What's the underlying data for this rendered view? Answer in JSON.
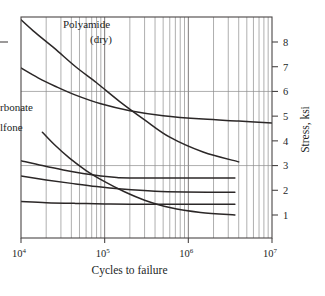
{
  "figure": {
    "background": "#ffffff",
    "frame_color": "#4a4646",
    "curve_color": "#2b2727",
    "grid_color": "#8d8d8d"
  },
  "axes": {
    "x_label": "Cycles to failure",
    "y_label": "Stress, ksi",
    "x_tick_labels": [
      "10",
      "10",
      "10",
      "10"
    ],
    "x_tick_exponents": [
      "4",
      "5",
      "6",
      "7"
    ],
    "y_tick_labels": [
      "8",
      "7",
      "6",
      "5",
      "4",
      "3",
      "2",
      "1"
    ]
  },
  "annotations": {
    "polyamide_line1": "Polyamide",
    "polyamide_line2": "(dry)",
    "carbonate": "rbonate",
    "sulfone": "lfone"
  },
  "chart_data": {
    "type": "line",
    "title": "",
    "xlabel": "Cycles to failure",
    "ylabel": "Stress, ksi",
    "xscale": "log",
    "yscale": "linear",
    "xlim": [
      10000,
      10000000
    ],
    "ylim": [
      0,
      9
    ],
    "xticks": [
      10000,
      100000,
      1000000,
      10000000
    ],
    "xticklabels": [
      "10^4",
      "10^5",
      "10^6",
      "10^7"
    ],
    "yticks": [
      1,
      2,
      3,
      4,
      5,
      6,
      7,
      8
    ],
    "grid": "log-minor vertical gridlines each decade (2-9); horizontal gridlines at stress 6 and 3",
    "legend": "inline curve labels",
    "annotations": [
      {
        "text": "Polyamide (dry)",
        "x": 30000,
        "y": 8.2
      },
      {
        "text": "Polycarbonate (partially cut off at left)",
        "x": 10500,
        "y": 5.2
      },
      {
        "text": "Polysulfone (partially cut off at left)",
        "x": 10500,
        "y": 4.4
      }
    ],
    "series": [
      {
        "name": "Polyamide (dry)",
        "points": [
          {
            "x": 8000,
            "y": 9.2
          },
          {
            "x": 14000,
            "y": 8.45
          },
          {
            "x": 25000,
            "y": 7.75
          },
          {
            "x": 45000,
            "y": 7.0
          },
          {
            "x": 80000,
            "y": 6.35
          },
          {
            "x": 150000,
            "y": 5.6
          },
          {
            "x": 300000,
            "y": 4.85
          },
          {
            "x": 600000,
            "y": 4.15
          },
          {
            "x": 1500000,
            "y": 3.55
          },
          {
            "x": 4000000,
            "y": 3.15
          }
        ]
      },
      {
        "name": "upper-flattening curve",
        "points": [
          {
            "x": 10000,
            "y": 6.95
          },
          {
            "x": 16000,
            "y": 6.55
          },
          {
            "x": 26000,
            "y": 6.2
          },
          {
            "x": 45000,
            "y": 5.85
          },
          {
            "x": 90000,
            "y": 5.5
          },
          {
            "x": 200000,
            "y": 5.22
          },
          {
            "x": 500000,
            "y": 5.02
          },
          {
            "x": 1500000,
            "y": 4.88
          },
          {
            "x": 4000000,
            "y": 4.8
          },
          {
            "x": 10000000,
            "y": 4.72
          }
        ]
      },
      {
        "name": "steep mid curve",
        "points": [
          {
            "x": 18000,
            "y": 4.35
          },
          {
            "x": 25000,
            "y": 3.85
          },
          {
            "x": 38000,
            "y": 3.3
          },
          {
            "x": 60000,
            "y": 2.8
          },
          {
            "x": 100000,
            "y": 2.35
          },
          {
            "x": 170000,
            "y": 1.95
          },
          {
            "x": 300000,
            "y": 1.6
          },
          {
            "x": 600000,
            "y": 1.3
          },
          {
            "x": 1400000,
            "y": 1.1
          },
          {
            "x": 3600000,
            "y": 1.0
          }
        ]
      },
      {
        "name": "plateau curve high",
        "points": [
          {
            "x": 10000,
            "y": 3.2
          },
          {
            "x": 18000,
            "y": 3.0
          },
          {
            "x": 32000,
            "y": 2.82
          },
          {
            "x": 55000,
            "y": 2.68
          },
          {
            "x": 90000,
            "y": 2.58
          },
          {
            "x": 140000,
            "y": 2.52
          },
          {
            "x": 200000,
            "y": 2.5
          },
          {
            "x": 3600000,
            "y": 2.5
          }
        ]
      },
      {
        "name": "plateau curve mid",
        "points": [
          {
            "x": 10000,
            "y": 2.58
          },
          {
            "x": 20000,
            "y": 2.42
          },
          {
            "x": 40000,
            "y": 2.28
          },
          {
            "x": 80000,
            "y": 2.15
          },
          {
            "x": 160000,
            "y": 2.05
          },
          {
            "x": 400000,
            "y": 1.96
          },
          {
            "x": 900000,
            "y": 1.93
          },
          {
            "x": 3600000,
            "y": 1.92
          }
        ]
      },
      {
        "name": "plateau curve low",
        "points": [
          {
            "x": 10000,
            "y": 1.55
          },
          {
            "x": 20000,
            "y": 1.5
          },
          {
            "x": 45000,
            "y": 1.47
          },
          {
            "x": 100000,
            "y": 1.45
          },
          {
            "x": 250000,
            "y": 1.44
          },
          {
            "x": 3600000,
            "y": 1.44
          }
        ]
      }
    ]
  }
}
